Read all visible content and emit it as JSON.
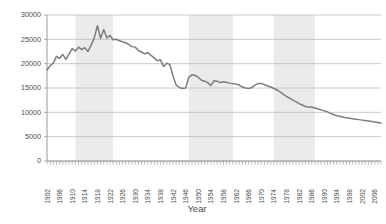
{
  "chart_data": {
    "type": "line",
    "title": "",
    "xlabel": "Year",
    "ylabel": "",
    "xlim": [
      1902,
      2008
    ],
    "ylim": [
      0,
      30000
    ],
    "grid": true,
    "legend": "none",
    "line_color": "#7c7c7c",
    "band_color": "#ebebeb",
    "grid_color": "#b5b5b5",
    "axis_color": "#9a9a9a",
    "text_color": "#4a4a4a",
    "ytick_labels": [
      "0",
      "5000",
      "10000",
      "15000",
      "20000",
      "25000",
      "30000"
    ],
    "ytick_values": [
      0,
      5000,
      10000,
      15000,
      20000,
      25000,
      30000
    ],
    "xtick_labels": [
      "1902",
      "1906",
      "1910",
      "1914",
      "1918",
      "1922",
      "1926",
      "1930",
      "1934",
      "1938",
      "1942",
      "1946",
      "1950",
      "1954",
      "1958",
      "1962",
      "1966",
      "1970",
      "1974",
      "1978",
      "1982",
      "1986",
      "1990",
      "1994",
      "1998",
      "2002",
      "2006"
    ],
    "xtick_values": [
      1902,
      1906,
      1910,
      1914,
      1918,
      1922,
      1926,
      1930,
      1934,
      1938,
      1942,
      1946,
      1950,
      1954,
      1958,
      1962,
      1966,
      1970,
      1974,
      1978,
      1982,
      1986,
      1990,
      1994,
      1998,
      2002,
      2006
    ],
    "shaded_bands": [
      {
        "start": 1911,
        "end": 1923
      },
      {
        "start": 1947,
        "end": 1961
      },
      {
        "start": 1974,
        "end": 1987
      }
    ],
    "x": [
      1902,
      1903,
      1904,
      1905,
      1906,
      1907,
      1908,
      1909,
      1910,
      1911,
      1912,
      1913,
      1914,
      1915,
      1916,
      1917,
      1918,
      1919,
      1920,
      1921,
      1922,
      1923,
      1924,
      1925,
      1926,
      1927,
      1928,
      1929,
      1930,
      1931,
      1932,
      1933,
      1934,
      1935,
      1936,
      1937,
      1938,
      1939,
      1940,
      1941,
      1942,
      1943,
      1944,
      1945,
      1946,
      1947,
      1948,
      1949,
      1950,
      1951,
      1952,
      1953,
      1954,
      1955,
      1956,
      1957,
      1958,
      1959,
      1960,
      1961,
      1962,
      1963,
      1964,
      1965,
      1966,
      1967,
      1968,
      1969,
      1970,
      1971,
      1972,
      1973,
      1974,
      1975,
      1976,
      1977,
      1978,
      1979,
      1980,
      1981,
      1982,
      1983,
      1984,
      1985,
      1986,
      1987,
      1988,
      1989,
      1990,
      1991,
      1992,
      1993,
      1994,
      1995,
      1996,
      1997,
      1998,
      1999,
      2000,
      2001,
      2002,
      2003,
      2004,
      2005,
      2006,
      2007,
      2008
    ],
    "values": [
      18700,
      19600,
      20100,
      21500,
      21100,
      21900,
      20900,
      22000,
      23100,
      22600,
      23400,
      22900,
      23300,
      22500,
      23800,
      25300,
      27800,
      25200,
      27000,
      25300,
      25800,
      24900,
      25000,
      24700,
      24500,
      24300,
      23900,
      23500,
      23400,
      22700,
      22400,
      22000,
      22300,
      21700,
      21200,
      20600,
      20800,
      19400,
      20100,
      19800,
      17400,
      15600,
      15100,
      14900,
      15000,
      17200,
      17700,
      17600,
      17200,
      16600,
      16400,
      16100,
      15500,
      16500,
      16400,
      16100,
      16300,
      16200,
      16000,
      15900,
      15800,
      15600,
      15200,
      15000,
      14900,
      15100,
      15600,
      15900,
      15900,
      15700,
      15400,
      15200,
      14900,
      14600,
      14200,
      13700,
      13300,
      12900,
      12500,
      12200,
      11800,
      11500,
      11200,
      11100,
      11100,
      10900,
      10700,
      10500,
      10300,
      10100,
      9800,
      9500,
      9300,
      9200,
      9000,
      8900,
      8800,
      8700,
      8600,
      8500,
      8400,
      8300,
      8200,
      8100,
      8000,
      7900,
      7800
    ]
  }
}
